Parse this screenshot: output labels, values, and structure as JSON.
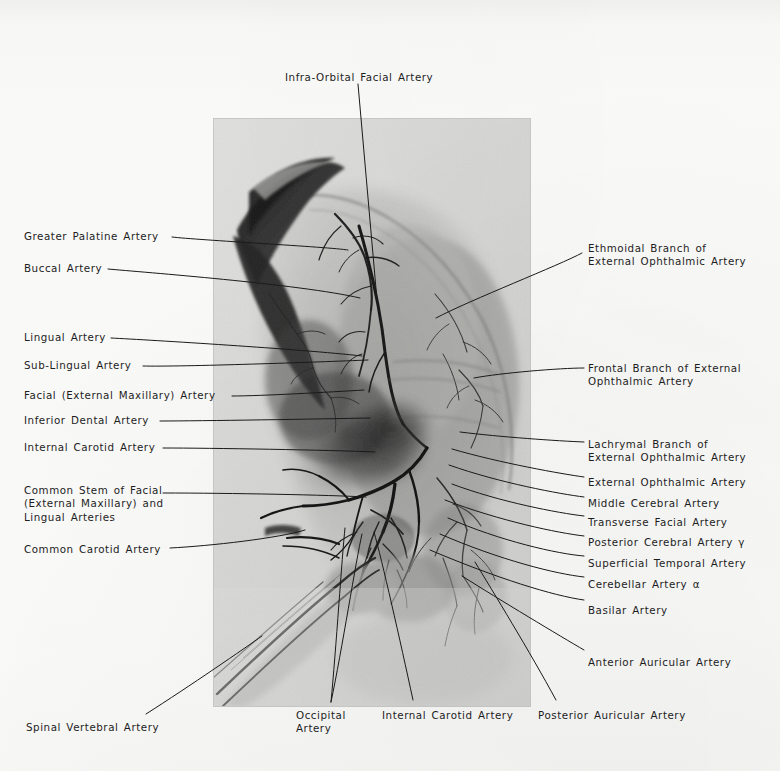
{
  "figure": {
    "type": "angiogram-plate",
    "plate": {
      "left": 213,
      "top": 118,
      "width": 318,
      "height": 589
    }
  },
  "labels": {
    "top": [
      {
        "id": "infra-orbital-facial-artery",
        "text": "Infra-Orbital Facial Artery",
        "x": 285,
        "y": 71,
        "align": "left",
        "leader": [
          [
            358,
            84
          ],
          [
            377,
            300
          ]
        ]
      }
    ],
    "left": [
      {
        "id": "greater-palatine-artery",
        "text": "Greater Palatine Artery",
        "x": 24,
        "y": 230,
        "align": "left",
        "leader": [
          [
            172,
            237
          ],
          [
            196,
            240
          ],
          [
            330,
            247
          ],
          [
            348,
            250
          ]
        ]
      },
      {
        "id": "buccal-artery",
        "text": "Buccal Artery",
        "x": 24,
        "y": 262,
        "align": "left",
        "leader": [
          [
            108,
            269
          ],
          [
            140,
            272
          ],
          [
            300,
            284
          ],
          [
            360,
            298
          ]
        ]
      },
      {
        "id": "lingual-artery",
        "text": "Lingual Artery",
        "x": 24,
        "y": 331,
        "align": "left",
        "leader": [
          [
            111,
            338
          ],
          [
            150,
            340
          ],
          [
            300,
            349
          ],
          [
            362,
            356
          ]
        ]
      },
      {
        "id": "sub-lingual-artery",
        "text": "Sub-Lingual Artery",
        "x": 24,
        "y": 359,
        "align": "left",
        "leader": [
          [
            143,
            366
          ],
          [
            180,
            367
          ],
          [
            320,
            362
          ],
          [
            368,
            360
          ]
        ]
      },
      {
        "id": "facial-external-maxillary-artery",
        "text": "Facial (External Maxillary) Artery",
        "x": 24,
        "y": 389,
        "align": "left",
        "leader": [
          [
            232,
            396
          ],
          [
            262,
            396
          ],
          [
            330,
            392
          ],
          [
            364,
            390
          ]
        ]
      },
      {
        "id": "inferior-dental-artery",
        "text": "Inferior Dental Artery",
        "x": 24,
        "y": 414,
        "align": "left",
        "leader": [
          [
            160,
            421
          ],
          [
            200,
            421
          ],
          [
            320,
            419
          ],
          [
            370,
            418
          ]
        ]
      },
      {
        "id": "internal-carotid-artery-left",
        "text": "Internal Carotid Artery",
        "x": 24,
        "y": 441,
        "align": "left",
        "leader": [
          [
            163,
            448
          ],
          [
            210,
            448
          ],
          [
            330,
            450
          ],
          [
            375,
            452
          ]
        ]
      },
      {
        "id": "common-stem-facial-lingual",
        "text": "Common Stem of Facial\n(External Maxillary) and\nLingual Arteries",
        "x": 24,
        "y": 484,
        "align": "left",
        "leader": [
          [
            163,
            493
          ],
          [
            230,
            493
          ],
          [
            330,
            495
          ],
          [
            366,
            497
          ]
        ]
      },
      {
        "id": "common-carotid-artery",
        "text": "Common Carotid Artery",
        "x": 24,
        "y": 543,
        "align": "left",
        "leader": [
          [
            170,
            548
          ],
          [
            210,
            546
          ],
          [
            280,
            538
          ],
          [
            305,
            530
          ]
        ]
      }
    ],
    "right": [
      {
        "id": "ethmoidal-branch-external-ophthalmic-artery",
        "text": "Ethmoidal Branch of\nExternal Ophthalmic Artery",
        "x": 588,
        "y": 242,
        "align": "left",
        "leader": [
          [
            582,
            253
          ],
          [
            560,
            265
          ],
          [
            470,
            300
          ],
          [
            436,
            318
          ]
        ]
      },
      {
        "id": "frontal-branch-external-ophthalmic-artery",
        "text": "Frontal Branch of External\nOphthalmic Artery",
        "x": 588,
        "y": 362,
        "align": "left",
        "leader": [
          [
            584,
            368
          ],
          [
            560,
            368
          ],
          [
            500,
            373
          ],
          [
            474,
            378
          ]
        ]
      },
      {
        "id": "lachrymal-branch-external-ophthalmic-artery",
        "text": "Lachrymal Branch of\nExternal Ophthalmic Artery",
        "x": 588,
        "y": 438,
        "align": "left",
        "leader": [
          [
            584,
            442
          ],
          [
            558,
            441
          ],
          [
            500,
            437
          ],
          [
            460,
            432
          ]
        ]
      },
      {
        "id": "external-ophthalmic-artery",
        "text": "External Ophthalmic Artery",
        "x": 588,
        "y": 476,
        "align": "left",
        "leader": [
          [
            584,
            477
          ],
          [
            562,
            474
          ],
          [
            500,
            463
          ],
          [
            452,
            449
          ]
        ]
      },
      {
        "id": "middle-cerebral-artery",
        "text": "Middle Cerebral Artery",
        "x": 588,
        "y": 497,
        "align": "left",
        "leader": [
          [
            584,
            497
          ],
          [
            560,
            494
          ],
          [
            500,
            483
          ],
          [
            449,
            465
          ]
        ]
      },
      {
        "id": "transverse-facial-artery",
        "text": "Transverse Facial Artery",
        "x": 588,
        "y": 516,
        "align": "left",
        "leader": [
          [
            584,
            516
          ],
          [
            558,
            513
          ],
          [
            500,
            502
          ],
          [
            452,
            484
          ]
        ]
      },
      {
        "id": "posterior-cerebral-artery-gamma",
        "text": "Posterior Cerebral Artery γ",
        "x": 588,
        "y": 536,
        "align": "left",
        "leader": [
          [
            584,
            536
          ],
          [
            558,
            533
          ],
          [
            500,
            521
          ],
          [
            445,
            500
          ]
        ]
      },
      {
        "id": "superficial-temporal-artery",
        "text": "Superficial Temporal Artery",
        "x": 588,
        "y": 557,
        "align": "left",
        "leader": [
          [
            584,
            556
          ],
          [
            558,
            554
          ],
          [
            500,
            541
          ],
          [
            448,
            518
          ]
        ]
      },
      {
        "id": "cerebellar-artery-alpha",
        "text": "Cerebellar Artery α",
        "x": 588,
        "y": 578,
        "align": "left",
        "leader": [
          [
            584,
            577
          ],
          [
            556,
            574
          ],
          [
            500,
            560
          ],
          [
            440,
            534
          ]
        ]
      },
      {
        "id": "basilar-artery",
        "text": "Basilar Artery",
        "x": 588,
        "y": 604,
        "align": "left",
        "leader": [
          [
            584,
            600
          ],
          [
            554,
            596
          ],
          [
            496,
            578
          ],
          [
            430,
            550
          ]
        ]
      },
      {
        "id": "anterior-auricular-artery",
        "text": "Anterior Auricular Artery",
        "x": 588,
        "y": 656,
        "align": "left",
        "leader": [
          [
            584,
            650
          ],
          [
            560,
            636
          ],
          [
            500,
            600
          ],
          [
            462,
            576
          ]
        ]
      }
    ],
    "bottom": [
      {
        "id": "spinal-vertebral-artery",
        "text": "Spinal Vertebral Artery",
        "x": 26,
        "y": 721,
        "align": "left",
        "leader": [
          [
            146,
            714
          ],
          [
            190,
            686
          ],
          [
            245,
            648
          ],
          [
            262,
            636
          ]
        ]
      },
      {
        "id": "occipital-artery",
        "text": "Occipital\nArtery",
        "x": 296,
        "y": 709,
        "align": "left",
        "leader": [
          [
            331,
            702
          ],
          [
            336,
            650
          ],
          [
            342,
            556
          ],
          [
            345,
            528
          ]
        ]
      },
      {
        "id": "occipital-artery-2",
        "text": "",
        "x": 0,
        "y": 0,
        "align": "left",
        "leader": [
          [
            331,
            702
          ],
          [
            342,
            650
          ],
          [
            356,
            560
          ],
          [
            362,
            534
          ]
        ]
      },
      {
        "id": "internal-carotid-artery-bottom",
        "text": "Internal Carotid Artery",
        "x": 382,
        "y": 709,
        "align": "left",
        "leader": [
          [
            413,
            700
          ],
          [
            400,
            640
          ],
          [
            382,
            560
          ],
          [
            374,
            532
          ]
        ]
      },
      {
        "id": "posterior-auricular-artery",
        "text": "Posterior Auricular Artery",
        "x": 538,
        "y": 709,
        "align": "left",
        "leader": [
          [
            556,
            700
          ],
          [
            530,
            652
          ],
          [
            492,
            590
          ],
          [
            475,
            562
          ]
        ]
      }
    ]
  },
  "colors": {
    "page_background": "#fbfbfa",
    "text": "#1d1d1d",
    "leader_line": "#1a1a1a",
    "plate_base": "#dcdcda",
    "vessel_dark": "#141414"
  }
}
